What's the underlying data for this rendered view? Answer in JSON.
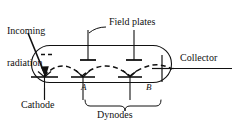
{
  "figure": {
    "stroke_color": "#111111",
    "background_color": "#ffffff"
  },
  "labels": {
    "incoming_radiation_line1": "Incoming",
    "incoming_radiation_line2": "radiation",
    "field_plates": "Field plates",
    "collector": "Collector",
    "cathode": "Cathode",
    "dynodes": "Dynodes",
    "dynode_a": "A",
    "dynode_b": "B"
  },
  "components": {
    "tube_envelope": "stadium-outline",
    "photocathode": "cathode-electrode",
    "dynode_a": "dynode-electrode-a",
    "dynode_b": "dynode-electrode-b",
    "collector_electrode": "collector-cross",
    "field_plate_1": "field-plate-left",
    "field_plate_2": "field-plate-right",
    "electron_path": "dashed-electron-trajectory",
    "radiation_arrow": "incoming-radiation-arrow",
    "dynodes_brace": "curly-brace"
  }
}
